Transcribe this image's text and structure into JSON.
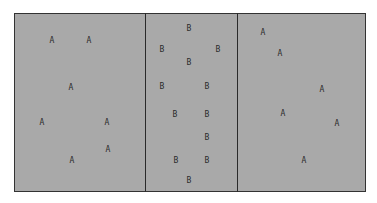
{
  "diagram": {
    "regions": [
      {
        "name": "left",
        "label": "A",
        "points": [
          [
            52,
            41
          ],
          [
            89,
            41
          ],
          [
            71,
            88
          ],
          [
            42,
            123
          ],
          [
            107,
            123
          ],
          [
            108,
            150
          ],
          [
            72,
            161
          ]
        ]
      },
      {
        "name": "middle",
        "label": "B",
        "points": [
          [
            189,
            29
          ],
          [
            162,
            50
          ],
          [
            218,
            50
          ],
          [
            189,
            63
          ],
          [
            162,
            87
          ],
          [
            207,
            87
          ],
          [
            175,
            115
          ],
          [
            207,
            115
          ],
          [
            207,
            138
          ],
          [
            176,
            161
          ],
          [
            207,
            161
          ],
          [
            189,
            181
          ]
        ]
      },
      {
        "name": "right",
        "label": "A",
        "points": [
          [
            263,
            33
          ],
          [
            280,
            54
          ],
          [
            322,
            90
          ],
          [
            283,
            114
          ],
          [
            337,
            124
          ],
          [
            304,
            161
          ]
        ]
      }
    ],
    "dividers_x": [
      145,
      237
    ],
    "colors": {
      "fill": "#a9a9a9",
      "border": "#333333",
      "text": "#2b2b2b"
    }
  }
}
